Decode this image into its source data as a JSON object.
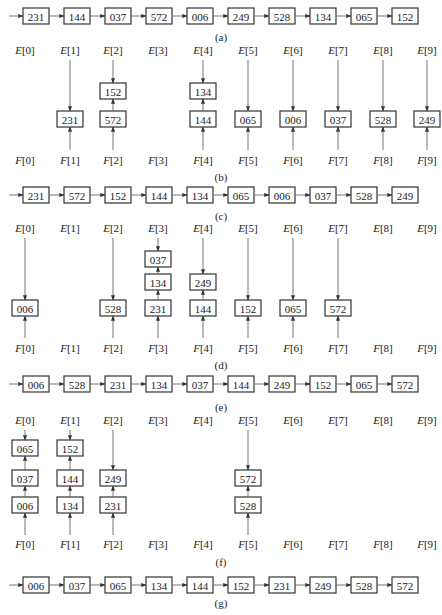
{
  "figure": {
    "columns": 10,
    "front_label_prefix": "E",
    "rear_label_prefix": "F",
    "panels": [
      {
        "id": "a",
        "caption": "(a)",
        "type": "list",
        "items": [
          "231",
          "144",
          "037",
          "572",
          "006",
          "249",
          "528",
          "134",
          "065",
          "152"
        ]
      },
      {
        "id": "b",
        "caption": "(b)",
        "type": "buckets",
        "buckets": [
          [],
          [
            "231"
          ],
          [
            "572",
            "152"
          ],
          [],
          [
            "144",
            "134"
          ],
          [
            "065"
          ],
          [
            "006"
          ],
          [
            "037"
          ],
          [
            "528"
          ],
          [
            "249"
          ]
        ]
      },
      {
        "id": "c",
        "caption": "(c)",
        "type": "list",
        "items": [
          "231",
          "572",
          "152",
          "144",
          "134",
          "065",
          "006",
          "037",
          "528",
          "249"
        ]
      },
      {
        "id": "d",
        "caption": "(d)",
        "type": "buckets",
        "buckets": [
          [
            "006"
          ],
          [],
          [
            "528"
          ],
          [
            "231",
            "134",
            "037"
          ],
          [
            "144",
            "249"
          ],
          [
            "152"
          ],
          [
            "065"
          ],
          [
            "572"
          ],
          [],
          []
        ]
      },
      {
        "id": "e",
        "caption": "(e)",
        "type": "list",
        "items": [
          "006",
          "528",
          "231",
          "134",
          "037",
          "144",
          "249",
          "152",
          "065",
          "572"
        ]
      },
      {
        "id": "f",
        "caption": "(f)",
        "type": "buckets",
        "buckets": [
          [
            "006",
            "037",
            "065"
          ],
          [
            "134",
            "144",
            "152"
          ],
          [
            "231",
            "249"
          ],
          [],
          [],
          [
            "528",
            "572"
          ],
          [],
          [],
          [],
          []
        ]
      },
      {
        "id": "g",
        "caption": "(g)",
        "type": "list",
        "items": [
          "006",
          "037",
          "065",
          "134",
          "144",
          "152",
          "231",
          "249",
          "528",
          "572"
        ]
      }
    ]
  },
  "layout": {
    "col_x": [
      25,
      70,
      113,
      158,
      203,
      248,
      293,
      338,
      383,
      427
    ],
    "list_box_x": [
      36,
      77,
      118,
      159,
      200,
      241,
      282,
      323,
      364,
      405
    ],
    "box_w": 26,
    "box_h": 16,
    "lists": {
      "a": {
        "y": 16,
        "cap_y": 41
      },
      "c": {
        "y": 195,
        "cap_y": 220
      },
      "e": {
        "y": 384,
        "cap_y": 411
      },
      "g": {
        "y": 585,
        "cap_y": 607
      }
    },
    "buckets": {
      "b": {
        "e_y": 54,
        "f_y": 164,
        "cap_y": 181,
        "box_y": [
          119,
          91,
          63
        ],
        "line_top": 60,
        "line_bot": 150
      },
      "d": {
        "e_y": 232,
        "f_y": 352,
        "cap_y": 369,
        "box_y": [
          308,
          282,
          259
        ],
        "line_top": 238,
        "line_bot": 338
      },
      "f": {
        "e_y": 424,
        "f_y": 548,
        "cap_y": 566,
        "box_y": [
          505,
          478,
          448
        ],
        "line_top": 430,
        "line_bot": 535
      }
    }
  }
}
